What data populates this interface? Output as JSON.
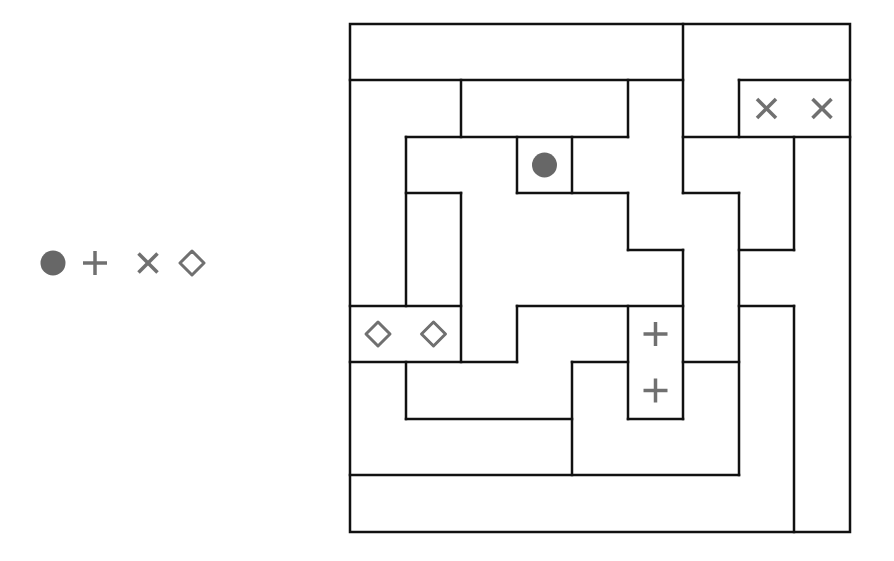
{
  "puzzle": {
    "type": "region-pairing",
    "grid": {
      "cols": 9,
      "rows": 9,
      "col_lines": [
        350,
        406,
        461,
        517,
        572,
        628,
        683,
        739,
        794,
        850
      ],
      "row_lines": [
        24,
        80,
        137,
        193,
        250,
        306,
        362,
        419,
        475,
        532
      ]
    },
    "walls": {
      "horizontal": [
        [
          1,
          0,
          6
        ],
        [
          1,
          7,
          9
        ],
        [
          2,
          1,
          5
        ],
        [
          2,
          6,
          9
        ],
        [
          3,
          1,
          2
        ],
        [
          3,
          3,
          5
        ],
        [
          3,
          6,
          7
        ],
        [
          4,
          5,
          6
        ],
        [
          4,
          7,
          8
        ],
        [
          5,
          0,
          2
        ],
        [
          5,
          3,
          6
        ],
        [
          5,
          7,
          8
        ],
        [
          6,
          0,
          3
        ],
        [
          6,
          4,
          5
        ],
        [
          6,
          6,
          7
        ],
        [
          7,
          1,
          4
        ],
        [
          7,
          5,
          6
        ],
        [
          8,
          0,
          7
        ]
      ],
      "vertical": [
        [
          2,
          1,
          2
        ],
        [
          5,
          1,
          2
        ],
        [
          6,
          0,
          3
        ],
        [
          7,
          1,
          2
        ],
        [
          1,
          2,
          5
        ],
        [
          3,
          2,
          3
        ],
        [
          4,
          2,
          3
        ],
        [
          2,
          3,
          6
        ],
        [
          5,
          3,
          4
        ],
        [
          7,
          3,
          8
        ],
        [
          8,
          2,
          4
        ],
        [
          6,
          4,
          7
        ],
        [
          3,
          5,
          6
        ],
        [
          5,
          5,
          7
        ],
        [
          1,
          6,
          7
        ],
        [
          4,
          6,
          8
        ],
        [
          8,
          5,
          9
        ]
      ]
    },
    "symbols": [
      {
        "type": "dot",
        "col": 3,
        "row": 2
      },
      {
        "type": "cross",
        "col": 7,
        "row": 1
      },
      {
        "type": "cross",
        "col": 8,
        "row": 1
      },
      {
        "type": "plus",
        "col": 5,
        "row": 5
      },
      {
        "type": "plus",
        "col": 5,
        "row": 6
      },
      {
        "type": "diamond",
        "col": 0,
        "row": 5
      },
      {
        "type": "diamond",
        "col": 1,
        "row": 5
      }
    ]
  },
  "legend": {
    "items": [
      {
        "type": "dot",
        "x": 53,
        "y": 263
      },
      {
        "type": "plus",
        "x": 95,
        "y": 263
      },
      {
        "type": "cross",
        "x": 148,
        "y": 263
      },
      {
        "type": "diamond",
        "x": 192,
        "y": 263
      }
    ]
  },
  "colors": {
    "background": "#ffffff",
    "wall": "#111111",
    "symbol": "#707070",
    "dot": "#676767"
  }
}
